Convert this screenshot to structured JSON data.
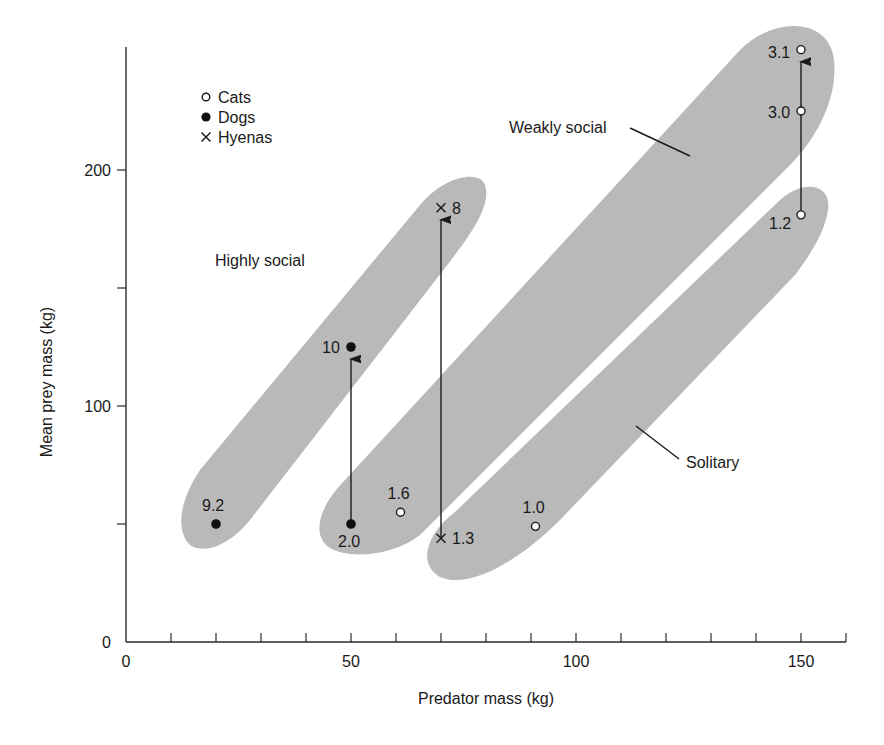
{
  "chart_data": {
    "type": "scatter",
    "title": "",
    "xlabel": "Predator mass (kg)",
    "ylabel": "Mean prey mass (kg)",
    "xlim": [
      0,
      160
    ],
    "ylim": [
      0,
      252
    ],
    "grid": false,
    "x_ticks_major": [
      0,
      50,
      100,
      150
    ],
    "x_tick_labels": [
      "0",
      "50",
      "100",
      "150"
    ],
    "x_ticks_minor_step": 10,
    "y_ticks_major": [
      0,
      100,
      200
    ],
    "y_tick_labels": [
      "0",
      "100",
      "200"
    ],
    "y_ticks_minor": [
      50,
      150
    ],
    "legend": {
      "position": "upper-left",
      "entries": [
        {
          "marker": "open-circle",
          "label": "Cats"
        },
        {
          "marker": "filled-circle",
          "label": "Dogs"
        },
        {
          "marker": "cross",
          "label": "Hyenas"
        }
      ]
    },
    "series": [
      {
        "name": "Cats",
        "marker": "open-circle",
        "points": [
          {
            "x": 150,
            "y": 251,
            "label": "3.1"
          },
          {
            "x": 150,
            "y": 225,
            "label": "3.0"
          },
          {
            "x": 150,
            "y": 181,
            "label": "1.2"
          },
          {
            "x": 61,
            "y": 55,
            "label": "1.6"
          },
          {
            "x": 91,
            "y": 49,
            "label": "1.0"
          }
        ]
      },
      {
        "name": "Dogs",
        "marker": "filled-circle",
        "points": [
          {
            "x": 50,
            "y": 125,
            "label": "10"
          },
          {
            "x": 50,
            "y": 50,
            "label": "2.0"
          },
          {
            "x": 20,
            "y": 50,
            "label": "9.2"
          }
        ]
      },
      {
        "name": "Hyenas",
        "marker": "cross",
        "points": [
          {
            "x": 70,
            "y": 184,
            "label": "8"
          },
          {
            "x": 70,
            "y": 44,
            "label": "1.3"
          }
        ]
      }
    ],
    "arrows": [
      {
        "from": {
          "x": 50,
          "y": 50
        },
        "to": {
          "x": 50,
          "y": 125
        },
        "desc": "Dogs 2.0 to 10"
      },
      {
        "from": {
          "x": 70,
          "y": 44
        },
        "to": {
          "x": 70,
          "y": 184
        },
        "desc": "Hyenas 1.3 to 8"
      },
      {
        "from": {
          "x": 150,
          "y": 181
        },
        "to": {
          "x": 150,
          "y": 251
        },
        "desc": "Cats 1.2 to 3.1"
      }
    ],
    "regions": [
      {
        "name": "Highly social",
        "label": "Highly social"
      },
      {
        "name": "Weakly social",
        "label": "Weakly social"
      },
      {
        "name": "Solitary",
        "label": "Solitary"
      }
    ],
    "annotations": "Numbers beside points indicate group size"
  }
}
